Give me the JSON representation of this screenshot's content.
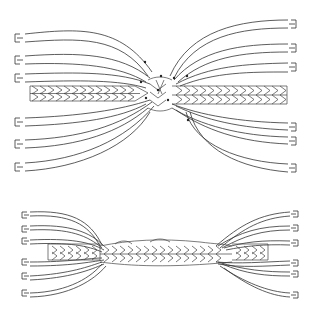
{
  "diagram": {
    "type": "technical-illustration",
    "figures": [
      {
        "id": "top",
        "description": "strands unlaid and fanned out from both ends around a central braided core, with tucks marked by dots",
        "strands_left": 6,
        "strands_right": 6
      },
      {
        "id": "bottom",
        "description": "splice tucked and tightened, strand ends fanning out on both sides",
        "strands_left": 6,
        "strands_right": 6
      }
    ],
    "colors": {
      "line": "#333333",
      "background": "#ffffff"
    }
  }
}
